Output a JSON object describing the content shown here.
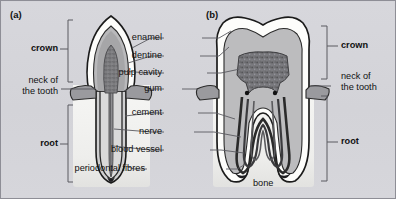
{
  "figure": {
    "panels": [
      {
        "id": "panel-a",
        "label": "(a)",
        "tooth": "incisor"
      },
      {
        "id": "panel-b",
        "label": "(b)",
        "tooth": "molar"
      }
    ],
    "center_labels": [
      {
        "name": "enamel",
        "text": "enamel"
      },
      {
        "name": "dentine",
        "text": "dentine"
      },
      {
        "name": "pulp-cavity",
        "text": "pulp cavity"
      },
      {
        "name": "gum",
        "text": "gum"
      },
      {
        "name": "cement",
        "text": "cement"
      },
      {
        "name": "nerve",
        "text": "nerve"
      },
      {
        "name": "blood-vessel",
        "text": "blood vessel"
      },
      {
        "name": "periodontal-fibres",
        "text": "periodontal fibres"
      }
    ],
    "left_labels": [
      {
        "name": "crown",
        "text": "crown",
        "bold": true
      },
      {
        "name": "neck-line-1",
        "text": "neck of",
        "bold": false
      },
      {
        "name": "neck-line-2",
        "text": "the tooth",
        "bold": false
      },
      {
        "name": "root",
        "text": "root",
        "bold": true
      }
    ],
    "right_labels": [
      {
        "name": "crown",
        "text": "crown",
        "bold": true
      },
      {
        "name": "neck-line-1",
        "text": "neck of",
        "bold": false
      },
      {
        "name": "neck-line-2",
        "text": "the tooth",
        "bold": false
      },
      {
        "name": "root",
        "text": "root",
        "bold": true
      }
    ],
    "bone_label": {
      "name": "bone",
      "text": "bone"
    },
    "colors": {
      "background": "#d5d5da",
      "border": "#8e8e96",
      "enamel": "#fdfdfb",
      "dentine": "#c7c7c8",
      "dentine_dark": "#a9a9ab",
      "pulp": "#8b8b8d",
      "pulp_dark": "#6f6f72",
      "gum": "#9a9a9e",
      "bone": "#f2f2f0",
      "outline": "#1b1b1b",
      "leader": "#5a5a60",
      "text": "#111111"
    }
  }
}
